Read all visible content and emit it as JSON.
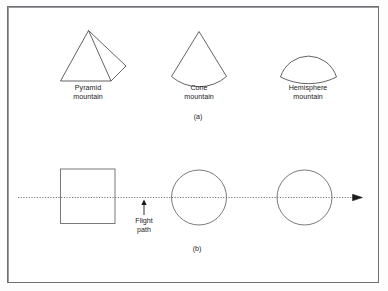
{
  "figure": {
    "panel_a": {
      "letter": "(a)",
      "shapes": [
        {
          "name": "pyramid-mountain",
          "label_line1": "Pyramid",
          "label_line2": "mountain"
        },
        {
          "name": "cone-mountain",
          "label_line1": "Cone",
          "label_line2": "mountain"
        },
        {
          "name": "hemisphere-mountain",
          "label_line1": "Hemisphere",
          "label_line2": "mountain"
        }
      ]
    },
    "panel_b": {
      "letter": "(b)",
      "annotation": {
        "line1": "Flight",
        "line2": "path"
      },
      "shapes": [
        {
          "name": "square-footprint",
          "type": "square"
        },
        {
          "name": "circle-footprint-1",
          "type": "circle"
        },
        {
          "name": "circle-footprint-2",
          "type": "circle"
        }
      ]
    },
    "colors": {
      "stroke": "#3c3c3c",
      "frame": "#6f7174",
      "text": "#1a1a1a",
      "background": "#ffffff"
    }
  }
}
